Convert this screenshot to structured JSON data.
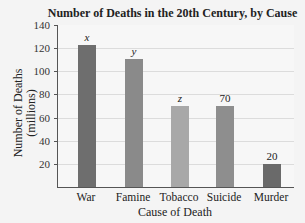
{
  "chart_data": {
    "type": "bar",
    "title": "Number of Deaths in the 20th Century, by Cause",
    "xlabel": "Cause of Death",
    "ylabel": "Number of Deaths (millions)",
    "ylabel_lines": [
      "Number of Deaths",
      "(millions)"
    ],
    "categories": [
      "War",
      "Famine",
      "Tobacco",
      "Suicide",
      "Murder"
    ],
    "values": [
      123,
      111,
      70,
      70,
      20
    ],
    "data_labels": [
      "x",
      "y",
      "z",
      "70",
      "20"
    ],
    "ylim": [
      0,
      140
    ],
    "yticks": [
      20,
      40,
      60,
      80,
      100,
      120,
      140
    ],
    "grid": true,
    "bar_colors": [
      "#6e6e6e",
      "#8a8a8a",
      "#a8a8a8",
      "#8e8e8e",
      "#6a6a6a"
    ]
  }
}
